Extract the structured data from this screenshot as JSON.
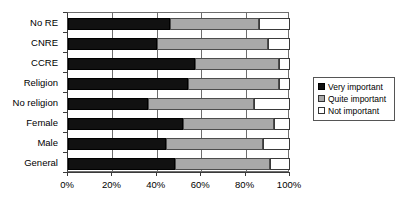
{
  "chart_data": {
    "type": "bar",
    "orientation": "horizontal",
    "stacked": true,
    "stack_mode": "percent",
    "title": "",
    "xlabel": "",
    "ylabel": "",
    "xlim": [
      0,
      100
    ],
    "grid": true,
    "legend_position": "right",
    "categories": [
      "No RE",
      "CNRE",
      "CCRE",
      "Religion",
      "No religion",
      "Female",
      "Male",
      "General"
    ],
    "xticks": [
      0,
      20,
      40,
      60,
      80,
      100
    ],
    "xtick_labels": [
      "0%",
      "20%",
      "40%",
      "60%",
      "80%",
      "100%"
    ],
    "series": [
      {
        "name": "Very important",
        "color": "#111111",
        "values": [
          46,
          40,
          57,
          54,
          36,
          52,
          44,
          48
        ]
      },
      {
        "name": "Quite important",
        "color": "#a9a9a9",
        "values": [
          40,
          50,
          38,
          41,
          48,
          41,
          44,
          43
        ]
      },
      {
        "name": "Not important",
        "color": "#ffffff",
        "values": [
          14,
          10,
          5,
          5,
          16,
          7,
          12,
          9
        ]
      }
    ]
  },
  "legend": {
    "items": [
      {
        "label": "Very important",
        "swatch": "black-square-icon"
      },
      {
        "label": "Quite important",
        "swatch": "gray-square-icon"
      },
      {
        "label": "Not important",
        "swatch": "white-square-icon"
      }
    ]
  }
}
